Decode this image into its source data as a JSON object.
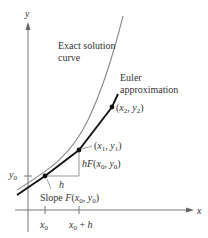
{
  "diagram": {
    "axes": {
      "x_label": "x",
      "y_label": "y"
    },
    "ticks": {
      "x": [
        {
          "base": "x",
          "sub": "0",
          "suffix": ""
        },
        {
          "base": "x",
          "sub": "0",
          "suffix": " + h"
        }
      ],
      "y": [
        {
          "base": "y",
          "sub": "0"
        }
      ]
    },
    "labels": {
      "exact_line1": "Exact solution",
      "exact_line2": "curve",
      "euler_line1": "Euler",
      "euler_line2": "approximation",
      "point2": "(x2, y2)",
      "point1": "(x1, y1)",
      "rise": "hF(x0, y0)",
      "run": "h",
      "slope": "Slope F(x0, y0)"
    },
    "points": [
      {
        "name": "(x0, y0)"
      },
      {
        "name": "(x1, y1)"
      },
      {
        "name": "(x2, y2)"
      }
    ],
    "colors": {
      "axis": "#777777",
      "exact_curve": "#8a8a8a",
      "euler": "#111111",
      "triangle": "#999999",
      "text": "#333333"
    }
  }
}
